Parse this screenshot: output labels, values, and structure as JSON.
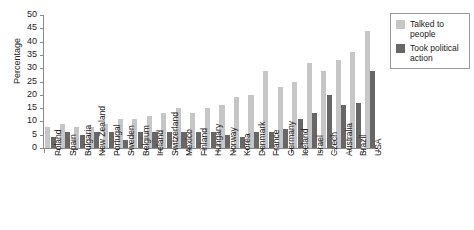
{
  "chart_data": {
    "type": "bar",
    "title": "",
    "xlabel": "",
    "ylabel": "Percentage",
    "ylim": [
      0,
      50
    ],
    "yticks": [
      0,
      5,
      10,
      15,
      20,
      25,
      30,
      35,
      40,
      45,
      50
    ],
    "grid": false,
    "legend_position": "right",
    "categories": [
      "Poland",
      "Spain",
      "Bulgaria",
      "New Zealand",
      "Portugal",
      "Sweden",
      "Belgium",
      "Ireland",
      "Switzerland",
      "Mexico",
      "Finland",
      "Hungary",
      "Norway",
      "Korea",
      "Denmark",
      "France",
      "Germany",
      "Iceland",
      "Israel",
      "Czech",
      "Australia",
      "Brazil",
      "USA"
    ],
    "series": [
      {
        "name": "Talked to people",
        "color": "#c6c6c6",
        "values": [
          8,
          9,
          8,
          8,
          9,
          11,
          11,
          12,
          13,
          15,
          13,
          15,
          16,
          19,
          20,
          29,
          23,
          25,
          32,
          29,
          33,
          36,
          44
        ]
      },
      {
        "name": "Took political action",
        "color": "#676767",
        "values": [
          4,
          6,
          5,
          6,
          6,
          3,
          6,
          6,
          6,
          6,
          6,
          6,
          5,
          4,
          6,
          6,
          7,
          11,
          13,
          20,
          16,
          17,
          29
        ]
      }
    ]
  },
  "legend": {
    "items": [
      {
        "label": "Talked to people",
        "color": "#c6c6c6"
      },
      {
        "label": "Took political action",
        "color": "#676767"
      }
    ]
  },
  "axes": {
    "y_title": "Percentage"
  }
}
